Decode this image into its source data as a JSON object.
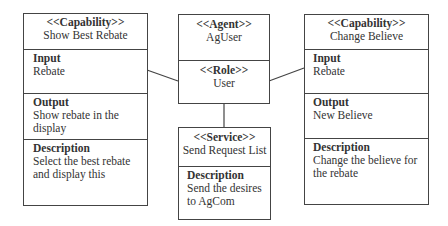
{
  "diagram": {
    "capability_left": {
      "stereotype": "<<Capability>>",
      "name": "Show Best Rebate",
      "input_label": "Input",
      "input_value": "Rebate",
      "output_label": "Output",
      "output_value_line1": "Show rebate in the",
      "output_value_line2": "display",
      "description_label": "Description",
      "description_line1": "Select the best rebate",
      "description_line2": "and display this"
    },
    "agent": {
      "stereotype": "<<Agent>>",
      "name": "AgUser"
    },
    "role": {
      "stereotype": "<<Role>>",
      "name": "User"
    },
    "service": {
      "stereotype": "<<Service>>",
      "name": "Send Request List",
      "description_label": "Description",
      "description_line1": "Send the desires",
      "description_line2": "to AgCom"
    },
    "capability_right": {
      "stereotype": "<<Capability>>",
      "name": "Change Believe",
      "input_label": "Input",
      "input_value": "Rebate",
      "output_label": "Output",
      "output_value": "New Believe",
      "description_label": "Description",
      "description_line1": "Change the believe for",
      "description_line2": "the rebate"
    }
  }
}
